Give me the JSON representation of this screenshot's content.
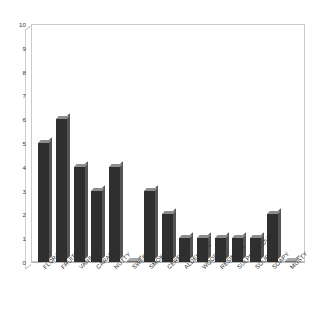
{
  "chart_data": {
    "type": "bar",
    "title": "",
    "subtitle": "",
    "xlabel": "",
    "ylabel": "",
    "ylim": [
      0,
      10
    ],
    "yticks": [
      10,
      9,
      8,
      7,
      6,
      5,
      4,
      3,
      2,
      1,
      0
    ],
    "grid": false,
    "legend": false,
    "legend_position": "none",
    "annotations": [],
    "style": {
      "bar_face_color": "#2f2f2f",
      "bar_side_color": "#545454",
      "bar_top_color": "#8d8d8d",
      "frame_color": "#c9c9c9",
      "baseline_color": "#b4b4b4",
      "background": "#ffffff",
      "tick_label_color": "#3a3a3a",
      "category_label_color": "#2b2b2b",
      "three_d": true
    },
    "categories": [
      "FLORAL",
      "FRUITY",
      "VANILLA",
      "CARAMEL",
      "NUTTY",
      "SWEET",
      "SMOKY",
      "CEREAL",
      "ALDEHYDIC",
      "WOODY",
      "RESINOUS",
      "SULPHUREOUS",
      "SOUR",
      "SOAPY",
      "MUSTY"
    ],
    "values": [
      5,
      6,
      4,
      3,
      4,
      0,
      3,
      2,
      1,
      1,
      1,
      1,
      1,
      2,
      0
    ]
  }
}
